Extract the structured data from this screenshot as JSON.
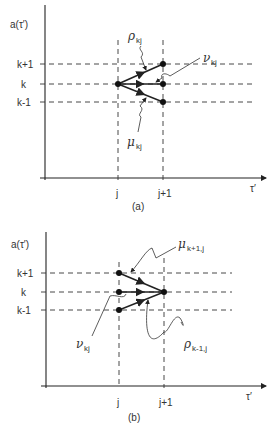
{
  "figure": {
    "panel_a": {
      "caption": "(a)",
      "y_axis_label": "a(τ′)",
      "x_axis_label": "τ′",
      "y_ticks": [
        "k+1",
        "k",
        "k-1"
      ],
      "x_ticks": [
        "j",
        "j+1"
      ],
      "annotations": [
        {
          "symbol": "ρ",
          "subscript": "kj",
          "meaning": "transition k→k+1"
        },
        {
          "symbol": "ν",
          "subscript": "kj",
          "meaning": "transition k→k"
        },
        {
          "symbol": "μ",
          "subscript": "kj",
          "meaning": "transition k→k-1"
        }
      ]
    },
    "panel_b": {
      "caption": "(b)",
      "y_axis_label": "a(τ′)",
      "x_axis_label": "τ′",
      "y_ticks": [
        "k+1",
        "k",
        "k-1"
      ],
      "x_ticks": [
        "j",
        "j+1"
      ],
      "annotations": [
        {
          "symbol": "μ",
          "subscript": "k+1,j",
          "meaning": "transition k+1→k"
        },
        {
          "symbol": "ν",
          "subscript": "kj",
          "meaning": "transition k→k"
        },
        {
          "symbol": "ρ",
          "subscript": "k-1,j",
          "meaning": "transition k-1→k"
        }
      ]
    }
  }
}
